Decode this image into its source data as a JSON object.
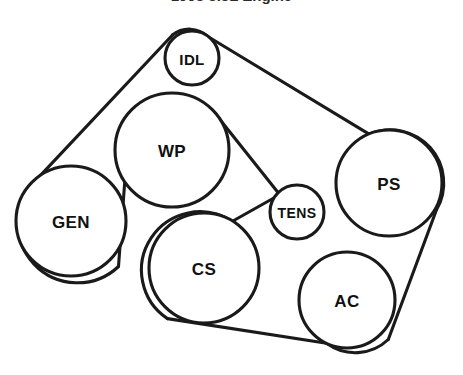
{
  "diagram": {
    "kind": "serpentine-belt-routing-diagram",
    "title_partial": "1998 3.8L Engine",
    "background_color": "#ffffff",
    "line_color": "#1a1a1a",
    "label_color": "#111111",
    "line_width": 3.1,
    "canvas": {
      "width": 463,
      "height": 375
    },
    "pulleys": [
      {
        "id": "idl",
        "label": "IDL",
        "cx": 192,
        "cy": 58,
        "r": 27,
        "font_size": 15
      },
      {
        "id": "wp",
        "label": "WP",
        "cx": 172,
        "cy": 150,
        "r": 57,
        "font_size": 17
      },
      {
        "id": "gen",
        "label": "GEN",
        "cx": 71,
        "cy": 221,
        "r": 55,
        "font_size": 17
      },
      {
        "id": "ps",
        "label": "PS",
        "cx": 389,
        "cy": 183,
        "r": 53,
        "font_size": 17
      },
      {
        "id": "tens",
        "label": "TENS",
        "cx": 297,
        "cy": 212,
        "r": 27,
        "font_size": 14
      },
      {
        "id": "cs",
        "label": "CS",
        "cx": 204,
        "cy": 268,
        "r": 55,
        "font_size": 17
      },
      {
        "id": "ac",
        "label": "AC",
        "cx": 347,
        "cy": 300,
        "r": 48,
        "font_size": 17
      }
    ],
    "belt_path_order": [
      "gen",
      "idl",
      "ps",
      "ac",
      "cs",
      "tens",
      "wp",
      "gen"
    ],
    "belt_spans": [
      {
        "id": "gen-to-idl",
        "from": "gen",
        "to": "idl",
        "d": "M 36.5 179.6 L 172.5 35.0"
      },
      {
        "id": "idl-to-ps",
        "from": "idl",
        "to": "ps",
        "d": "M 207.8 36.5 L 369.5 134.4"
      },
      {
        "id": "ps-to-ac",
        "from": "ps",
        "to": "ac",
        "d": "M 436.6 209.5 L 388.3 339.5"
      },
      {
        "id": "ac-to-cs",
        "from": "ac",
        "to": "cs",
        "d": "M 326.7 343.3 L 167.5 318.6"
      },
      {
        "id": "cs-to-tens",
        "from": "cs",
        "to": "tens",
        "d": "M 232.0 221.5 L 283.6 192.5"
      },
      {
        "id": "tens-to-wp",
        "from": "tens",
        "to": "wp",
        "d": "M 281.0 196.3 L 213.5 111.5"
      },
      {
        "id": "wp-to-gen",
        "from": "wp",
        "to": "gen",
        "d": "M 124.8 181.0 L 118.5 266.5"
      }
    ],
    "belt_arcs": [
      {
        "id": "arc-gen",
        "pulley": "gen",
        "d": "M 118.5 266.5 A 55 55 0 1 1 36.5 179.6"
      },
      {
        "id": "arc-idl",
        "pulley": "idl",
        "d": "M 172.5 35.0 A 27 27 0 0 1 207.8 36.5"
      },
      {
        "id": "arc-ps",
        "pulley": "ps",
        "d": "M 369.5 134.4 A 53 53 0 0 1 436.6 209.5"
      },
      {
        "id": "arc-ac",
        "pulley": "ac",
        "d": "M 388.3 339.5 A 48 48 0 0 1 326.7 343.3"
      },
      {
        "id": "arc-cs",
        "pulley": "cs",
        "d": "M 167.5 318.6 A 55 55 0 0 1 232.0 221.5"
      },
      {
        "id": "arc-tens",
        "pulley": "tens",
        "d": "M 283.6 192.5 A 27 27 0 0 1 281.0 196.3"
      },
      {
        "id": "arc-wp",
        "pulley": "wp",
        "d": "M 213.5 111.5 A 57 57 0 0 1 124.8 181.0"
      }
    ]
  }
}
